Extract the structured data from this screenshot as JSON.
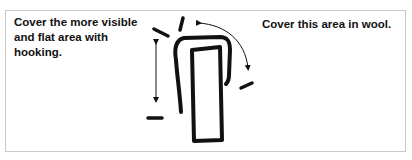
{
  "figure": {
    "labels": {
      "left": "Cover the more visible\nand flat area with\nhooking.",
      "right": "Cover this area in wool."
    },
    "colors": {
      "border": "#c8c8c8",
      "ink": "#111111",
      "background": "#ffffff"
    },
    "elements": [
      "outer-u-shape-outline",
      "inner-rectangle-shape",
      "vertical-double-arrow",
      "curved-double-arrow",
      "tick-marks"
    ]
  }
}
